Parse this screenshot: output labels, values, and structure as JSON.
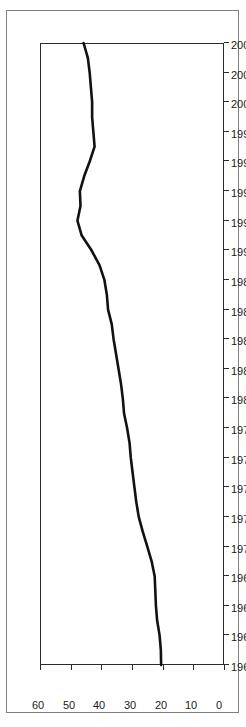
{
  "chart_data": {
    "type": "line",
    "title": "",
    "subtitle": "",
    "xlabel": "",
    "ylabel": "",
    "xlim": [
      1962,
      2004
    ],
    "ylim": [
      0,
      60
    ],
    "grid": false,
    "legend": null,
    "orientation": "rotated-90",
    "xticklabels": [
      "1962",
      "1964",
      "1966",
      "1968",
      "1970",
      "1972",
      "1974",
      "1976",
      "1978",
      "1980",
      "1982",
      "1984",
      "1986",
      "1988",
      "1990",
      "1992",
      "1994",
      "1996",
      "1998",
      "2000",
      "2002",
      "2004"
    ],
    "yticklabels": [
      "0",
      "10",
      "20",
      "30",
      "40",
      "50",
      "60"
    ],
    "xticks": [
      1962,
      1964,
      1966,
      1968,
      1970,
      1972,
      1974,
      1976,
      1978,
      1980,
      1982,
      1984,
      1986,
      1988,
      1990,
      1992,
      1994,
      1996,
      1998,
      2000,
      2002,
      2004
    ],
    "yticks": [
      0,
      10,
      20,
      30,
      40,
      50,
      60
    ],
    "series": [
      {
        "name": "series-1",
        "color": "#111111",
        "linewidth": 2.6,
        "x": [
          1962,
          1963,
          1964,
          1965,
          1966,
          1967,
          1968,
          1969,
          1970,
          1971,
          1972,
          1973,
          1974,
          1975,
          1976,
          1977,
          1978,
          1979,
          1980,
          1981,
          1982,
          1983,
          1984,
          1985,
          1986,
          1987,
          1988,
          1989,
          1990,
          1991,
          1992,
          1993,
          1994,
          1995,
          1996,
          1997,
          1998,
          1999,
          2000,
          2001,
          2002,
          2003,
          2004
        ],
        "values": [
          20.5,
          20.6,
          21.0,
          21.8,
          22.2,
          22.4,
          22.6,
          23.6,
          25.0,
          26.5,
          27.8,
          28.6,
          29.2,
          29.8,
          30.4,
          30.8,
          31.6,
          32.6,
          33.0,
          33.6,
          34.4,
          35.2,
          36.0,
          36.6,
          37.8,
          38.2,
          39.0,
          40.6,
          43.2,
          46.4,
          47.8,
          46.8,
          47.0,
          45.6,
          43.8,
          42.2,
          42.6,
          43.0,
          43.0,
          43.4,
          43.8,
          44.4,
          45.8
        ]
      }
    ]
  }
}
